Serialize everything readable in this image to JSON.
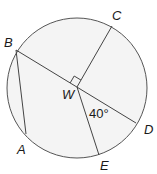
{
  "diagram": {
    "type": "circle-geometry",
    "circle": {
      "center_label": "W",
      "fill": "#f4f4f4",
      "stroke": "#555555"
    },
    "points": {
      "A": "A",
      "B": "B",
      "C": "C",
      "D": "D",
      "E": "E",
      "W": "W"
    },
    "segments": [
      "BD",
      "WC",
      "WE",
      "BA"
    ],
    "right_angle_at": "W (between WB and WC)",
    "angle_label": "40°",
    "angle_between": "WD and WE"
  }
}
